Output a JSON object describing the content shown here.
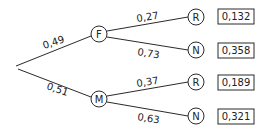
{
  "tree": {
    "root": {
      "x": 16,
      "y": 66
    },
    "level1": [
      {
        "id": "F",
        "label": "F",
        "prob": "0,49",
        "x": 99,
        "y": 34
      },
      {
        "id": "M",
        "label": "M",
        "prob": "0,51",
        "x": 99,
        "y": 99
      }
    ],
    "level2": [
      {
        "parent": "F",
        "label": "R",
        "prob": "0,27",
        "x": 196,
        "y": 17,
        "result": "0,132"
      },
      {
        "parent": "F",
        "label": "N",
        "prob": "0,73",
        "x": 196,
        "y": 50,
        "result": "0,358"
      },
      {
        "parent": "M",
        "label": "R",
        "prob": "0,37",
        "x": 196,
        "y": 82,
        "result": "0,189"
      },
      {
        "parent": "M",
        "label": "N",
        "prob": "0,63",
        "x": 196,
        "y": 116,
        "result": "0,321"
      }
    ]
  },
  "colors": {
    "line": "#2a2a2a",
    "text": "#222222",
    "background": "#ffffff"
  }
}
